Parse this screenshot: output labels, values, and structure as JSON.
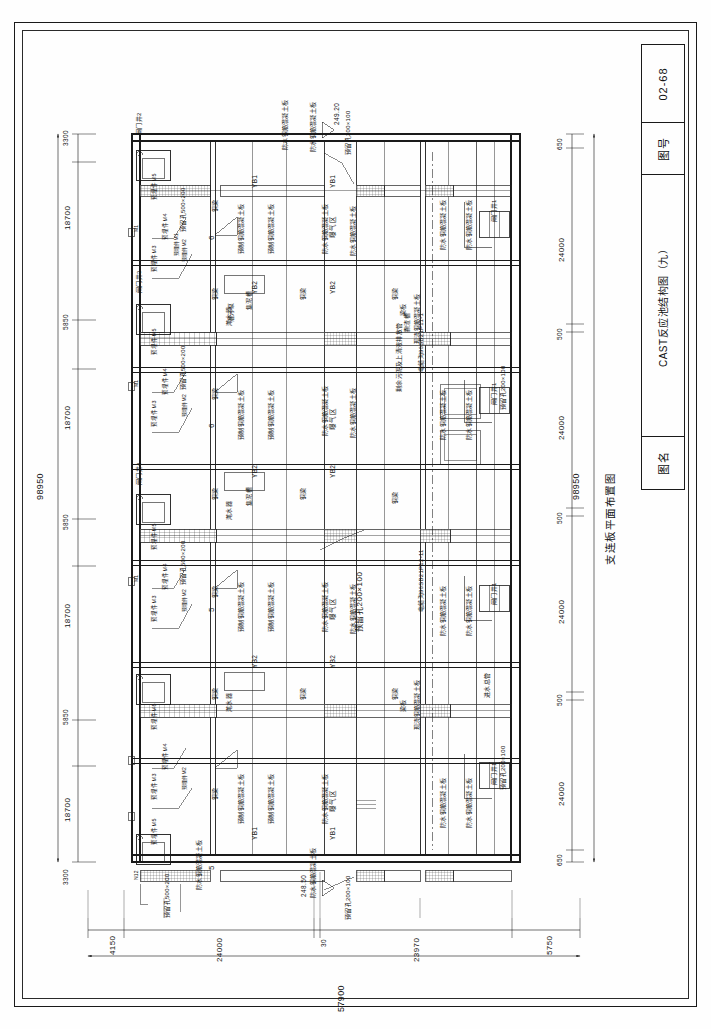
{
  "sheet": {
    "title_block": {
      "name_label": "图名",
      "name_value": "CAST反应池结构图（九）",
      "number_label": "图号",
      "number_value": "02-68"
    },
    "caption": "支连板平面布置图"
  },
  "dimensions": {
    "left_chain": {
      "total": "98950",
      "segments": [
        "3300",
        "18700",
        "5850",
        "18700",
        "5850",
        "18700",
        "5850",
        "18700",
        "3300"
      ]
    },
    "right_chain": {
      "total": "98950",
      "segments": [
        "650",
        "24000",
        "500",
        "24000",
        "500",
        "24000",
        "500",
        "24000",
        "650"
      ]
    },
    "bottom_chain": {
      "total": "57900",
      "segments": [
        "4150",
        "24000",
        "30",
        "23970",
        "5750"
      ]
    }
  },
  "elevations": [
    {
      "value": "249.20"
    },
    {
      "value": "248.50"
    }
  ],
  "annotations": {
    "gate_shafts": [
      "闸门井2",
      "闸门井3",
      "闸门井4",
      "闸门井1",
      "闸门井1"
    ],
    "embedded_parts": [
      "预埋件M5",
      "预埋件M4",
      "预埋件M3",
      "预埋件M2",
      "预埋件M1",
      "M1",
      "M2",
      "N12"
    ],
    "slabs": [
      "预制钢筋混凝土板",
      "防水钢筋混凝土板",
      "现浇钢筋混凝土板",
      "钢筋混凝土板"
    ],
    "beams": [
      "钢梁",
      "梁板",
      "YB1",
      "YB2"
    ],
    "reserved_holes": [
      "预留孔500×200",
      "预留孔200×100",
      "预留孔200×100",
      "预留孔500×200",
      "预留孔200×100"
    ],
    "zones": [
      "曝气区",
      "滗水区",
      "污泥区",
      "进水区"
    ],
    "equipment": [
      "滗水器",
      "撇渣槽",
      "集泥槽",
      "潜污泵"
    ],
    "pipe_notes": [
      "电缆沟96SB21P12-11",
      "电缆沟96SB21P11-1",
      "剩余污泥及上清液排放管",
      "进水总管"
    ],
    "section_marks": [
      "5",
      "6",
      "5",
      "6"
    ]
  }
}
